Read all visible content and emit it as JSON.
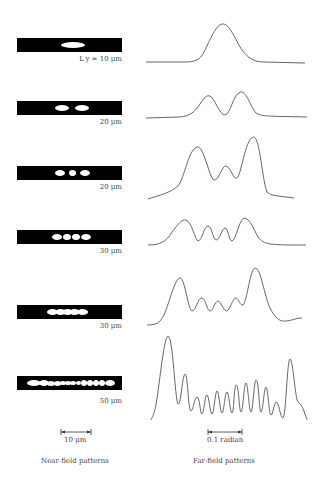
{
  "figure": {
    "rows": [
      {
        "label": "L_y = 10 μm",
        "label_display": "L y = 10 μm",
        "near_field_spots": 1
      },
      {
        "label": "20 μm",
        "label_display": "20 μm",
        "near_field_spots": 2
      },
      {
        "label": "20 μm",
        "label_display": "20 μm",
        "near_field_spots": 3
      },
      {
        "label": "30 μm",
        "label_display": "30 μm",
        "near_field_spots": 4
      },
      {
        "label": "30 μm",
        "label_display": "30 μm",
        "near_field_spots": 5
      },
      {
        "label": "50 μm",
        "label_display": "50 μm",
        "near_field_spots": 13
      }
    ],
    "near_scale": "10 μm",
    "far_scale": "0.1 radian",
    "near_caption": "Near-field patterns",
    "far_caption": "Far-field patterns"
  }
}
